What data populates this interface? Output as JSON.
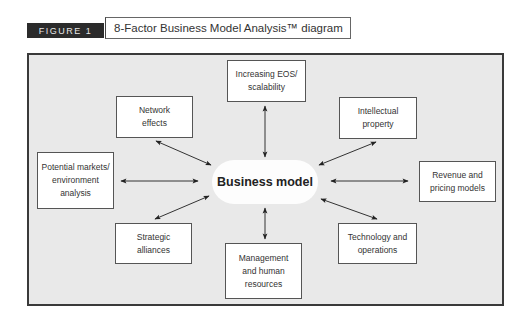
{
  "header": {
    "figure_label": "FIGURE 1",
    "title": "8-Factor Business Model Analysis™ diagram"
  },
  "diagram": {
    "center": {
      "label": "Business model"
    },
    "nodes": [
      {
        "id": "scalability",
        "label": "Increasing EOS/\nscalability"
      },
      {
        "id": "network",
        "label": "Network\neffects"
      },
      {
        "id": "intellectual",
        "label": "Intellectual\nproperty"
      },
      {
        "id": "markets",
        "label": "Potential markets/\nenvironment\nanalysis"
      },
      {
        "id": "revenue",
        "label": "Revenue and\npricing models"
      },
      {
        "id": "strategic",
        "label": "Strategic\nalliances"
      },
      {
        "id": "technology",
        "label": "Technology and\noperations"
      },
      {
        "id": "management",
        "label": "Management\nand human\nresources"
      }
    ],
    "edges": [
      {
        "from": "center",
        "to": "scalability",
        "type": "bidirectional"
      },
      {
        "from": "center",
        "to": "network",
        "type": "bidirectional"
      },
      {
        "from": "center",
        "to": "intellectual",
        "type": "bidirectional"
      },
      {
        "from": "center",
        "to": "markets",
        "type": "bidirectional"
      },
      {
        "from": "center",
        "to": "revenue",
        "type": "bidirectional"
      },
      {
        "from": "center",
        "to": "strategic",
        "type": "bidirectional"
      },
      {
        "from": "center",
        "to": "technology",
        "type": "bidirectional"
      },
      {
        "from": "center",
        "to": "management",
        "type": "bidirectional"
      }
    ]
  }
}
